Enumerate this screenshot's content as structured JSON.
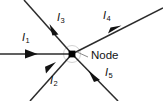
{
  "diagram": {
    "type": "circuit-node-current-junction",
    "background_color": "#ffffff",
    "line_color": "#2b2b2b",
    "arrow_color": "#121212",
    "label_color": "#0d0d0d",
    "leader_color": "#8a8a8a",
    "halo_color": "#d2d2d2",
    "node": {
      "label": "Node",
      "marker": "filled-square-dot",
      "x": 72,
      "y": 54
    },
    "currents": [
      {
        "id": "I1",
        "symbol": "I",
        "subscript": "1",
        "label": "I1",
        "direction": "into-node",
        "orientation": "horizontal-right",
        "label_x": 22,
        "label_y": 35
      },
      {
        "id": "I2",
        "symbol": "I",
        "subscript": "2",
        "label": "I2",
        "direction": "into-node",
        "orientation": "up-right",
        "label_x": 49,
        "label_y": 78
      },
      {
        "id": "I3",
        "symbol": "I",
        "subscript": "3",
        "label": "I3",
        "direction": "into-node",
        "orientation": "down-right",
        "label_x": 57,
        "label_y": 15
      },
      {
        "id": "I4",
        "symbol": "I",
        "subscript": "4",
        "label": "I4",
        "direction": "out-of-node",
        "orientation": "up-right",
        "label_x": 102,
        "label_y": 13
      },
      {
        "id": "I5",
        "symbol": "I",
        "subscript": "5",
        "label": "I5",
        "direction": "out-of-node",
        "orientation": "down-right",
        "label_x": 105,
        "label_y": 70
      }
    ],
    "node_label": {
      "text": "Node",
      "x": 92,
      "y": 53
    }
  }
}
